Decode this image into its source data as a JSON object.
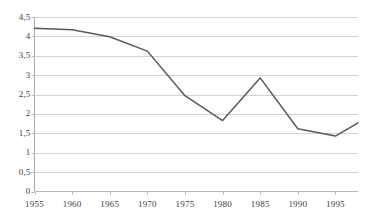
{
  "chart_data": {
    "type": "line",
    "title": "",
    "subtitle": "",
    "xlabel": "",
    "ylabel": "",
    "x": [
      1955,
      1960,
      1965,
      1970,
      1975,
      1980,
      1985,
      1990,
      1995,
      1998
    ],
    "values": [
      4.21,
      4.17,
      3.99,
      3.62,
      2.47,
      1.83,
      2.93,
      1.62,
      1.43,
      1.77
    ],
    "series": [
      {
        "name": "",
        "values": [
          4.21,
          4.17,
          3.99,
          3.62,
          2.47,
          1.83,
          2.93,
          1.62,
          1.43,
          1.77
        ]
      }
    ],
    "xlim": [
      1955,
      1998
    ],
    "ylim": [
      0,
      4.5
    ],
    "y_ticks": [
      0,
      0.5,
      1,
      1.5,
      2,
      2.5,
      3,
      3.5,
      4,
      4.5
    ],
    "y_tick_labels": [
      "0",
      "0,5",
      "1",
      "1,5",
      "2",
      "2,5",
      "3",
      "3,5",
      "4",
      "4,5"
    ],
    "x_ticks": [
      1955,
      1960,
      1965,
      1970,
      1975,
      1980,
      1985,
      1990,
      1995
    ],
    "x_tick_labels": [
      "1955",
      "1960",
      "1965",
      "1970",
      "1975",
      "1980",
      "1985",
      "1990",
      "1995"
    ],
    "grid": "horizontal",
    "legend": "none",
    "series_color": "#595959",
    "grid_color": "#d4d4d4",
    "axis_color": "#b8b8b8",
    "background": "#ffffff"
  }
}
